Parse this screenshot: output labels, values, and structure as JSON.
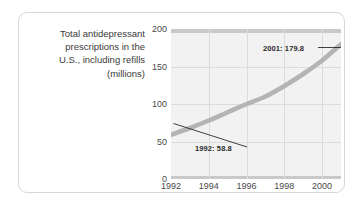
{
  "caption": {
    "lines": [
      "Total antidepressant",
      "prescriptions in the",
      "U.S., including refills",
      "(millions)"
    ]
  },
  "chart_data": {
    "type": "line",
    "title": "Total antidepressant prescriptions in the U.S., including refills (millions)",
    "xlabel": "",
    "ylabel": "millions",
    "x": [
      1992,
      1993,
      1994,
      1995,
      1996,
      1997,
      1998,
      1999,
      2000,
      2001
    ],
    "values": [
      58.8,
      68.0,
      78.0,
      89.0,
      100.0,
      110.0,
      124.0,
      140.0,
      158.0,
      179.8
    ],
    "xlim": [
      1992,
      2001
    ],
    "ylim": [
      0,
      200
    ],
    "yticks": [
      "0",
      "50",
      "100",
      "150",
      "200"
    ],
    "ytick_values": [
      0,
      50,
      100,
      150,
      200
    ],
    "xticks": [
      "1992",
      "1994",
      "1996",
      "1998",
      "2000"
    ],
    "xtick_values": [
      1992,
      1994,
      1996,
      1998,
      2000
    ],
    "grid": true,
    "legend": "none",
    "series_color": "#b4b4b4",
    "plot_background": "#f2f2f2",
    "gridline_color": "#dcdcdc",
    "annotations": [
      {
        "label": "2001: 179.8",
        "x": 2001,
        "y": 179.8
      },
      {
        "label": "1992: 58.8",
        "x": 1992,
        "y": 58.8
      }
    ]
  }
}
